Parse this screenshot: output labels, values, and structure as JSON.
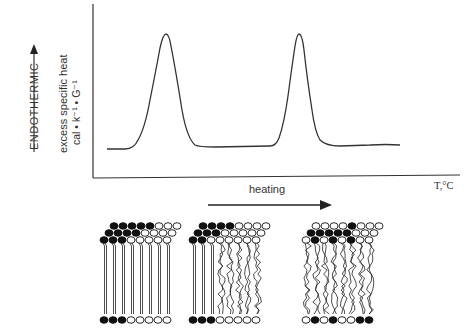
{
  "axes": {
    "direction_label": "ENDOTHERMIC",
    "y_label_line1": "excess specific heat",
    "y_label_line2": "cal • k⁻¹ • G⁻¹",
    "x_unit": "T,°C",
    "x_arrow_label": "heating"
  },
  "curve": {
    "description": "Thermogram with two endothermic transition peaks",
    "peaks": [
      {
        "x_px": 166,
        "y_px": 34
      },
      {
        "x_px": 298,
        "y_px": 34
      }
    ],
    "baseline_y_px": 148
  },
  "membrane_illustrations": [
    {
      "name": "gel-phase-bilayer",
      "state": "ordered"
    },
    {
      "name": "phase-separated-bilayer",
      "state": "partially-melted"
    },
    {
      "name": "fluid-phase-bilayer",
      "state": "disordered"
    }
  ]
}
